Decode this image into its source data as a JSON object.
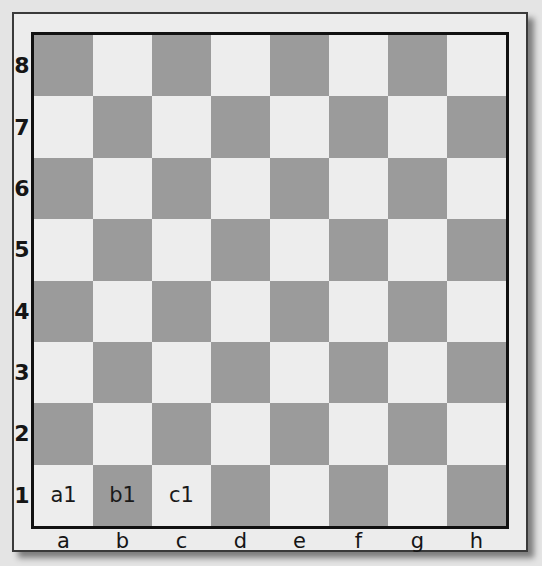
{
  "board": {
    "ranks": [
      "8",
      "7",
      "6",
      "5",
      "4",
      "3",
      "2",
      "1"
    ],
    "files": [
      "a",
      "b",
      "c",
      "d",
      "e",
      "f",
      "g",
      "h"
    ],
    "colors": {
      "light": "#ededed",
      "dark": "#9b9b9b",
      "border": "#111111"
    },
    "square_labels": {
      "a1": "a1",
      "b1": "b1",
      "c1": "c1"
    }
  }
}
